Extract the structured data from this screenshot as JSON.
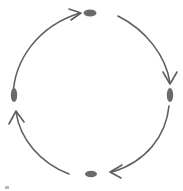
{
  "diagram": {
    "type": "cycle",
    "direction": "clockwise",
    "background_color": "#ffffff",
    "stroke_color": "#5e5e5e",
    "node_color": "#6a6a6a",
    "stroke_width": 1.6,
    "canvas": {
      "width": 183,
      "height": 191
    },
    "center": {
      "x": 91,
      "y": 97
    },
    "nodes": [
      {
        "id": "node-top",
        "label": "",
        "shape": "ellipse-horizontal",
        "cx": 90,
        "cy": 13,
        "rx": 6.5,
        "ry": 3.5,
        "color": "#6a6a6a"
      },
      {
        "id": "node-right",
        "label": "",
        "shape": "ellipse-vertical",
        "cx": 170,
        "cy": 95,
        "rx": 3.2,
        "ry": 7.0,
        "color": "#6a6a6a"
      },
      {
        "id": "node-bottom",
        "label": "",
        "shape": "ellipse-horizontal",
        "cx": 91,
        "cy": 174,
        "rx": 6.0,
        "ry": 3.2,
        "color": "#6a6a6a"
      },
      {
        "id": "node-left",
        "label": "",
        "shape": "ellipse-vertical",
        "cx": 14,
        "cy": 95,
        "rx": 3.2,
        "ry": 7.0,
        "color": "#6a6a6a"
      }
    ],
    "arrows": [
      {
        "id": "arrow-left-to-top",
        "from": "node-left",
        "to": "node-top",
        "label": "",
        "path": "M 13 96 C 14 60, 38 26, 80 13",
        "head": "M 69 9 L 81 13 L 71 20",
        "color": "#5e5e5e"
      },
      {
        "id": "arrow-top-to-right",
        "from": "node-top",
        "to": "node-right",
        "label": "",
        "path": "M 118 16 C 146 30, 166 56, 170 83",
        "head": "M 163 72 L 170 84 L 177 72",
        "color": "#5e5e5e"
      },
      {
        "id": "arrow-right-to-bottom",
        "from": "node-right",
        "to": "node-bottom",
        "label": "",
        "path": "M 169 106 C 166 136, 146 162, 112 172",
        "head": "M 122 165 L 110 172 L 121 178",
        "color": "#5e5e5e"
      },
      {
        "id": "arrow-bottom-to-left",
        "from": "node-bottom",
        "to": "node-left",
        "label": "",
        "path": "M 69 174 C 40 163, 20 139, 16 112",
        "head": "M 9 124 L 16 111 L 24 122",
        "color": "#5e5e5e"
      }
    ],
    "artifacts": [
      {
        "id": "corner-speck",
        "x": 5,
        "y": 186,
        "width": 4,
        "height": 3,
        "color": "#b9b9b9"
      }
    ]
  }
}
